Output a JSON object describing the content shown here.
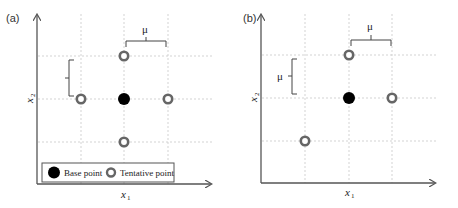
{
  "panels": [
    {
      "id": "a",
      "label": "(a)",
      "x_axis_label": "x",
      "x_axis_sub": "1",
      "y_axis_label": "x",
      "y_axis_sub": "2",
      "step_label_top": "μ",
      "step_label_left": "",
      "base_point": {
        "col": 1,
        "row": 1
      },
      "tentative_points": [
        {
          "col": 1,
          "row": 0
        },
        {
          "col": 0,
          "row": 1
        },
        {
          "col": 2,
          "row": 1
        },
        {
          "col": 1,
          "row": 2
        }
      ],
      "legend": {
        "base_label": "Base point",
        "tentative_label": "Tentative point"
      }
    },
    {
      "id": "b",
      "label": "(b)",
      "x_axis_label": "x",
      "x_axis_sub": "1",
      "y_axis_label": "x",
      "y_axis_sub": "2",
      "step_label_top": "μ",
      "step_label_left": "μ",
      "base_point": {
        "col": 1,
        "row": 1
      },
      "tentative_points": [
        {
          "col": 1,
          "row": 0
        },
        {
          "col": 2,
          "row": 1
        },
        {
          "col": 0,
          "row": 2
        }
      ]
    }
  ],
  "colors": {
    "axis": "#555555",
    "grid": "#c8c8c8",
    "base_fill": "#000000",
    "tentative_ring": "#666666"
  }
}
